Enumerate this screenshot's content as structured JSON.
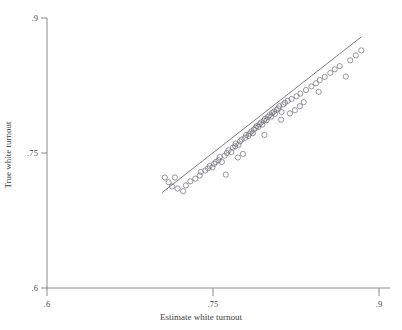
{
  "chart_data": {
    "type": "scatter",
    "title": "",
    "subtitle": "",
    "xlabel": "Estimate white turnout",
    "ylabel": "True white turnout",
    "xlim": [
      0.6,
      0.9
    ],
    "ylim": [
      0.6,
      0.9
    ],
    "xticks": [
      0.6,
      0.75,
      0.9
    ],
    "yticks": [
      0.6,
      0.75,
      0.9
    ],
    "xtick_labels": [
      ".6",
      ".75",
      ".9"
    ],
    "ytick_labels": [
      ".6",
      ".75",
      ".9"
    ],
    "grid": false,
    "legend": null,
    "marker": {
      "shape": "open-circle",
      "radius_px": 2.6,
      "stroke": "#6b6b74",
      "fill": "none",
      "stroke_width": 0.7
    },
    "fit_line": {
      "label": "",
      "color": "#5a5a62",
      "width": 0.8,
      "x_start": 0.704,
      "y_start": 0.706,
      "x_end": 0.884,
      "y_end": 0.879
    },
    "points": [
      {
        "x": 0.7065,
        "y": 0.7228
      },
      {
        "x": 0.7155,
        "y": 0.7228
      },
      {
        "x": 0.713,
        "y": 0.7128
      },
      {
        "x": 0.718,
        "y": 0.7105
      },
      {
        "x": 0.7255,
        "y": 0.714
      },
      {
        "x": 0.7295,
        "y": 0.7185
      },
      {
        "x": 0.734,
        "y": 0.7215
      },
      {
        "x": 0.738,
        "y": 0.725
      },
      {
        "x": 0.739,
        "y": 0.729
      },
      {
        "x": 0.743,
        "y": 0.7305
      },
      {
        "x": 0.7455,
        "y": 0.733
      },
      {
        "x": 0.747,
        "y": 0.7355
      },
      {
        "x": 0.7495,
        "y": 0.734
      },
      {
        "x": 0.751,
        "y": 0.738
      },
      {
        "x": 0.7525,
        "y": 0.74
      },
      {
        "x": 0.755,
        "y": 0.742
      },
      {
        "x": 0.756,
        "y": 0.7455
      },
      {
        "x": 0.758,
        "y": 0.74
      },
      {
        "x": 0.7605,
        "y": 0.747
      },
      {
        "x": 0.7625,
        "y": 0.75
      },
      {
        "x": 0.764,
        "y": 0.753
      },
      {
        "x": 0.7665,
        "y": 0.751
      },
      {
        "x": 0.768,
        "y": 0.756
      },
      {
        "x": 0.77,
        "y": 0.7575
      },
      {
        "x": 0.7705,
        "y": 0.7605
      },
      {
        "x": 0.773,
        "y": 0.759
      },
      {
        "x": 0.7745,
        "y": 0.763
      },
      {
        "x": 0.776,
        "y": 0.765
      },
      {
        "x": 0.777,
        "y": 0.749
      },
      {
        "x": 0.779,
        "y": 0.767
      },
      {
        "x": 0.78,
        "y": 0.77
      },
      {
        "x": 0.782,
        "y": 0.769
      },
      {
        "x": 0.783,
        "y": 0.7715
      },
      {
        "x": 0.7845,
        "y": 0.774
      },
      {
        "x": 0.786,
        "y": 0.772
      },
      {
        "x": 0.787,
        "y": 0.776
      },
      {
        "x": 0.7885,
        "y": 0.778
      },
      {
        "x": 0.7895,
        "y": 0.78
      },
      {
        "x": 0.791,
        "y": 0.779
      },
      {
        "x": 0.792,
        "y": 0.782
      },
      {
        "x": 0.7935,
        "y": 0.784
      },
      {
        "x": 0.7945,
        "y": 0.7815
      },
      {
        "x": 0.796,
        "y": 0.786
      },
      {
        "x": 0.797,
        "y": 0.788
      },
      {
        "x": 0.7985,
        "y": 0.7865
      },
      {
        "x": 0.7995,
        "y": 0.79
      },
      {
        "x": 0.801,
        "y": 0.792
      },
      {
        "x": 0.8025,
        "y": 0.7905
      },
      {
        "x": 0.8035,
        "y": 0.7945
      },
      {
        "x": 0.805,
        "y": 0.796
      },
      {
        "x": 0.806,
        "y": 0.7935
      },
      {
        "x": 0.8075,
        "y": 0.798
      },
      {
        "x": 0.809,
        "y": 0.7995
      },
      {
        "x": 0.81,
        "y": 0.802
      },
      {
        "x": 0.812,
        "y": 0.7955
      },
      {
        "x": 0.8135,
        "y": 0.804
      },
      {
        "x": 0.815,
        "y": 0.806
      },
      {
        "x": 0.8175,
        "y": 0.808
      },
      {
        "x": 0.8195,
        "y": 0.794
      },
      {
        "x": 0.821,
        "y": 0.81
      },
      {
        "x": 0.824,
        "y": 0.7975
      },
      {
        "x": 0.8255,
        "y": 0.813
      },
      {
        "x": 0.829,
        "y": 0.816
      },
      {
        "x": 0.832,
        "y": 0.8065
      },
      {
        "x": 0.834,
        "y": 0.82
      },
      {
        "x": 0.839,
        "y": 0.824
      },
      {
        "x": 0.843,
        "y": 0.8275
      },
      {
        "x": 0.8465,
        "y": 0.831
      },
      {
        "x": 0.851,
        "y": 0.8345
      },
      {
        "x": 0.856,
        "y": 0.839
      },
      {
        "x": 0.86,
        "y": 0.843
      },
      {
        "x": 0.8645,
        "y": 0.8465
      },
      {
        "x": 0.87,
        "y": 0.835
      },
      {
        "x": 0.874,
        "y": 0.853
      },
      {
        "x": 0.879,
        "y": 0.8585
      },
      {
        "x": 0.884,
        "y": 0.864
      },
      {
        "x": 0.7615,
        "y": 0.726
      },
      {
        "x": 0.7725,
        "y": 0.745
      },
      {
        "x": 0.7965,
        "y": 0.77
      },
      {
        "x": 0.8115,
        "y": 0.787
      },
      {
        "x": 0.8285,
        "y": 0.802
      },
      {
        "x": 0.8455,
        "y": 0.818
      },
      {
        "x": 0.723,
        "y": 0.7075
      },
      {
        "x": 0.71,
        "y": 0.7175
      }
    ]
  },
  "axes": {
    "x_title": "Estimate white turnout",
    "y_title": "True white turnout",
    "x_ticks": [
      {
        "value": 0.6,
        "label": ".6"
      },
      {
        "value": 0.75,
        "label": ".75"
      },
      {
        "value": 0.9,
        "label": ".9"
      }
    ],
    "y_ticks": [
      {
        "value": 0.6,
        "label": ".6"
      },
      {
        "value": 0.75,
        "label": ".75"
      },
      {
        "value": 0.9,
        "label": ".9"
      }
    ]
  },
  "colors": {
    "axis": "#6e6e72",
    "marker_stroke": "#6b6b74",
    "fit_line": "#5a5a62",
    "text": "#3d3d3d",
    "background": "#ffffff"
  }
}
